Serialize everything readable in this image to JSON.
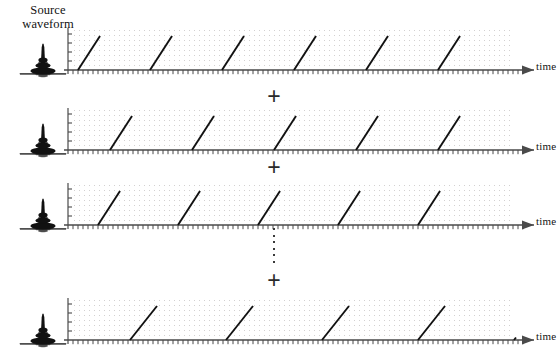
{
  "figure": {
    "title_line1": "Source",
    "title_line2": "waveform",
    "background_color": "#ffffff",
    "ink_color": "#1a1a1a",
    "grid_dot_color": "#c9c6c6",
    "axis_color": "#4a4a4a",
    "waveform_color": "#111111"
  },
  "operators": {
    "plus": "+",
    "vertical_ellipsis": "⋮",
    "plus_count": 3,
    "ellipsis_dot_count": 6
  },
  "axes": {
    "x_label": "time",
    "y_label": "",
    "x_tick_count": 96,
    "x_tick_spacing_px": 5,
    "y_tick_count": 4,
    "arrowhead": true,
    "grid": "dotted"
  },
  "rows": [
    {
      "index": 1,
      "source_waveform_name": "source-wavelet-burst",
      "time_label": "time",
      "ramp_train": {
        "type": "sawtooth",
        "period_px": 72,
        "first_start_px": 4,
        "ramp_width_px": 22,
        "ramp_height_px": 34,
        "count": 6
      }
    },
    {
      "index": 2,
      "source_waveform_name": "source-wavelet-burst",
      "time_label": "time",
      "ramp_train": {
        "type": "sawtooth",
        "period_px": 82,
        "first_start_px": 36,
        "ramp_width_px": 22,
        "ramp_height_px": 34,
        "count": 5
      }
    },
    {
      "index": 3,
      "source_waveform_name": "source-wavelet-burst",
      "time_label": "time",
      "ramp_train": {
        "type": "sawtooth",
        "period_px": 80,
        "first_start_px": 24,
        "ramp_width_px": 22,
        "ramp_height_px": 34,
        "count": 5
      }
    },
    {
      "index": 4,
      "source_waveform_name": "source-wavelet-burst",
      "time_label": "time",
      "ramp_train": {
        "type": "sawtooth",
        "period_px": 96,
        "first_start_px": 56,
        "ramp_width_px": 27,
        "ramp_height_px": 34,
        "count": 5
      }
    }
  ],
  "layout": {
    "row_tops": [
      22,
      102,
      177,
      292
    ],
    "plus_positions": [
      [
        262,
        84
      ],
      [
        262,
        155
      ],
      [
        262,
        268
      ]
    ],
    "ellipsis_position": [
      262,
      228
    ]
  }
}
